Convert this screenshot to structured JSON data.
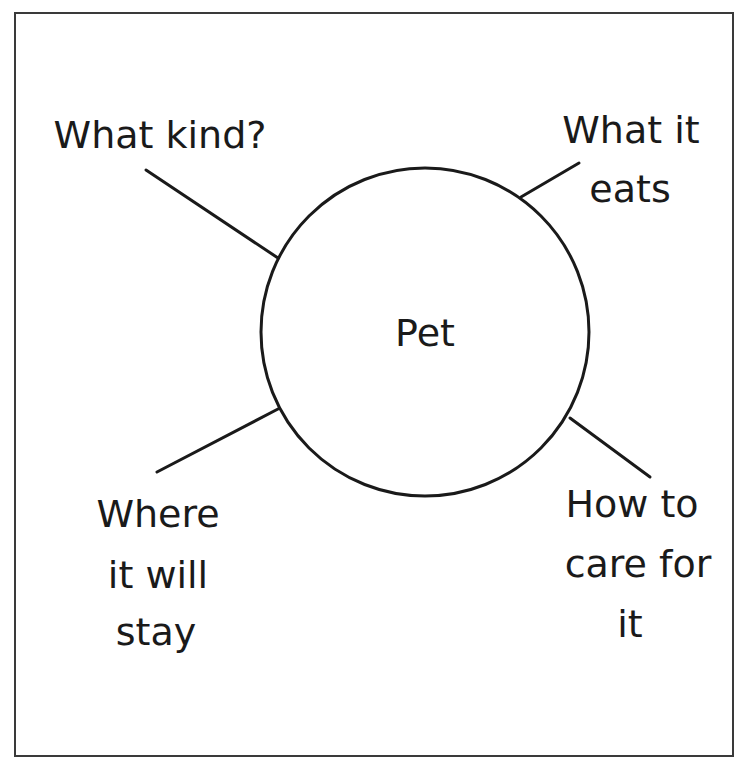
{
  "diagram": {
    "type": "concept-web",
    "center": {
      "label": "Pet"
    },
    "branches": [
      {
        "id": "what-kind",
        "lines": [
          "What kind?"
        ]
      },
      {
        "id": "what-it-eats",
        "lines": [
          "What it",
          "eats"
        ]
      },
      {
        "id": "where-it-will-stay",
        "lines": [
          "Where",
          "it will",
          "stay"
        ]
      },
      {
        "id": "how-to-care",
        "lines": [
          "How to",
          "care for",
          "it"
        ]
      }
    ]
  },
  "colors": {
    "stroke": "#1a1a1a",
    "frame": "#3a3a3a",
    "background": "#ffffff"
  }
}
